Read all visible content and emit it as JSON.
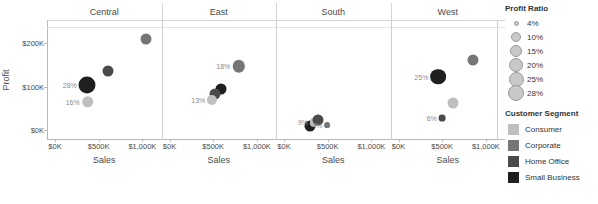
{
  "chart_data": {
    "type": "scatter",
    "title": "",
    "xlabel": "Sales",
    "ylabel": "Profit",
    "facet_field": "Region",
    "facets": [
      "Central",
      "East",
      "South",
      "West"
    ],
    "xlim": [
      0,
      1150000
    ],
    "ylim": [
      -20000,
      250000
    ],
    "xticks": [
      0,
      500000,
      1000000
    ],
    "xtick_labels": [
      "$0K",
      "$500K",
      "$1,000K"
    ],
    "yticks": [
      0,
      100000,
      200000
    ],
    "ytick_labels": [
      "$0K",
      "$100K",
      "$200K"
    ],
    "grid": true,
    "legend_position": "right",
    "size_field": "Profit Ratio",
    "color_field": "Customer Segment",
    "points": [
      {
        "facet": "Central",
        "segment": "Small Business",
        "sales": 370000,
        "profit": 104000,
        "profit_ratio": "28%",
        "label": "28%"
      },
      {
        "facet": "Central",
        "segment": "Consumer",
        "sales": 372000,
        "profit": 65000,
        "profit_ratio": "16%",
        "label": "16%"
      },
      {
        "facet": "Central",
        "segment": "Home Office",
        "sales": 610000,
        "profit": 136000,
        "profit_ratio": "",
        "label": ""
      },
      {
        "facet": "Central",
        "segment": "Corporate",
        "sales": 1045000,
        "profit": 209000,
        "profit_ratio": "",
        "label": ""
      },
      {
        "facet": "East",
        "segment": "Corporate",
        "sales": 790000,
        "profit": 146000,
        "profit_ratio": "18%",
        "label": "18%"
      },
      {
        "facet": "East",
        "segment": "Small Business",
        "sales": 585000,
        "profit": 95000,
        "profit_ratio": "",
        "label": ""
      },
      {
        "facet": "East",
        "segment": "Home Office",
        "sales": 520000,
        "profit": 83000,
        "profit_ratio": "",
        "label": ""
      },
      {
        "facet": "East",
        "segment": "Consumer",
        "sales": 490000,
        "profit": 70000,
        "profit_ratio": "13%",
        "label": "13%"
      },
      {
        "facet": "South",
        "segment": "Small Business",
        "sales": 300000,
        "profit": 9000,
        "profit_ratio": "",
        "label": ""
      },
      {
        "facet": "South",
        "segment": "Consumer",
        "sales": 345000,
        "profit": 18000,
        "profit_ratio": "9%",
        "label": "9%"
      },
      {
        "facet": "South",
        "segment": "Home Office",
        "sales": 390000,
        "profit": 24000,
        "profit_ratio": "",
        "label": ""
      },
      {
        "facet": "South",
        "segment": "Corporate",
        "sales": 495000,
        "profit": 12000,
        "profit_ratio": "4%",
        "label": "4%"
      },
      {
        "facet": "West",
        "segment": "Small Business",
        "sales": 455000,
        "profit": 123000,
        "profit_ratio": "25%",
        "label": "25%"
      },
      {
        "facet": "West",
        "segment": "Corporate",
        "sales": 850000,
        "profit": 160000,
        "profit_ratio": "",
        "label": ""
      },
      {
        "facet": "West",
        "segment": "Consumer",
        "sales": 625000,
        "profit": 62000,
        "profit_ratio": "",
        "label": ""
      },
      {
        "facet": "West",
        "segment": "Home Office",
        "sales": 500000,
        "profit": 27000,
        "profit_ratio": "6%",
        "label": "6%"
      }
    ]
  },
  "legend": {
    "size_legend": {
      "title": "Profit Ratio",
      "entries": [
        {
          "label": "4%",
          "diameter": 5
        },
        {
          "label": "10%",
          "diameter": 10
        },
        {
          "label": "15%",
          "diameter": 12
        },
        {
          "label": "20%",
          "diameter": 14
        },
        {
          "label": "25%",
          "diameter": 15
        },
        {
          "label": "28%",
          "diameter": 16
        }
      ]
    },
    "color_legend": {
      "title": "Customer Segment",
      "entries": [
        {
          "label": "Consumer",
          "color": "#bfbfbf"
        },
        {
          "label": "Corporate",
          "color": "#767676"
        },
        {
          "label": "Home Office",
          "color": "#4a4a4a"
        },
        {
          "label": "Small Business",
          "color": "#1f1f1f"
        }
      ]
    }
  },
  "colors": {
    "consumer": "#bfbfbf",
    "corporate": "#767676",
    "home_office": "#4a4a4a",
    "small_business": "#1f1f1f",
    "axis": "#b8b8b8",
    "grid": "#e3e3e3",
    "text": "#4a4a4a",
    "label": "#8a8a8a"
  }
}
